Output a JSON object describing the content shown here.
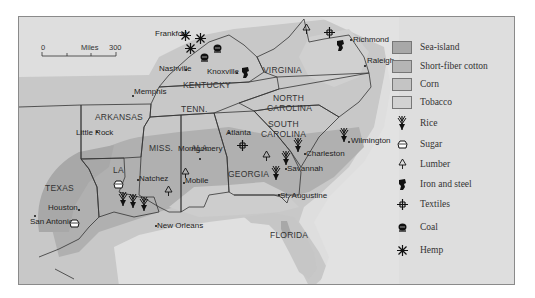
{
  "map": {
    "scale_bar": {
      "start": "0",
      "unit": "Miles",
      "end": "300"
    },
    "states": [
      {
        "name": "KENTUCKY",
        "x": 182,
        "y": 80
      },
      {
        "name": "VIRGINIA",
        "x": 262,
        "y": 65
      },
      {
        "name": "TENN.",
        "x": 180,
        "y": 104
      },
      {
        "name": "NORTH",
        "x": 272,
        "y": 93
      },
      {
        "name": "CAROLINA",
        "x": 266,
        "y": 103
      },
      {
        "name": "ARKANSAS",
        "x": 94,
        "y": 112
      },
      {
        "name": "SOUTH",
        "x": 267,
        "y": 119
      },
      {
        "name": "CAROLINA",
        "x": 260,
        "y": 129
      },
      {
        "name": "MISS.",
        "x": 148,
        "y": 143
      },
      {
        "name": "ALA.",
        "x": 190,
        "y": 143
      },
      {
        "name": "GEORGIA",
        "x": 227,
        "y": 169
      },
      {
        "name": "LA",
        "x": 112,
        "y": 165
      },
      {
        "name": "TEXAS",
        "x": 44,
        "y": 183
      },
      {
        "name": "FLORIDA",
        "x": 269,
        "y": 230
      }
    ],
    "cities": [
      {
        "name": "Frankfort",
        "x": 181,
        "y": 33,
        "dx": -27,
        "dy": -4
      },
      {
        "name": "Richmond",
        "x": 349,
        "y": 38,
        "dx": 3,
        "dy": -3
      },
      {
        "name": "Nashville",
        "x": 184,
        "y": 68,
        "dx": -26,
        "dy": -4
      },
      {
        "name": "Knoxville",
        "x": 235,
        "y": 71,
        "dx": -29,
        "dy": -4
      },
      {
        "name": "Raleigh",
        "x": 363,
        "y": 64,
        "dx": 3,
        "dy": -8
      },
      {
        "name": "Memphis",
        "x": 131,
        "y": 94,
        "dx": 2,
        "dy": -7
      },
      {
        "name": "Little Rock",
        "x": 95,
        "y": 130,
        "dx": -20,
        "dy": -2
      },
      {
        "name": "Atlanta",
        "x": 227,
        "y": 131,
        "dx": -2,
        "dy": -3
      },
      {
        "name": "Wilmington",
        "x": 347,
        "y": 140,
        "dx": 3,
        "dy": -4
      },
      {
        "name": "Montgomery",
        "x": 198,
        "y": 157,
        "dx": -21,
        "dy": -13
      },
      {
        "name": "Charleston",
        "x": 303,
        "y": 152,
        "dx": 2,
        "dy": -3
      },
      {
        "name": "Natchez",
        "x": 136,
        "y": 178,
        "dx": 2,
        "dy": -4
      },
      {
        "name": "Mobile",
        "x": 182,
        "y": 181,
        "dx": 2,
        "dy": -5
      },
      {
        "name": "Savannah",
        "x": 284,
        "y": 167,
        "dx": 2,
        "dy": -3
      },
      {
        "name": "St. Augustine",
        "x": 277,
        "y": 193,
        "dx": 2,
        "dy": -2
      },
      {
        "name": "Houston",
        "x": 77,
        "y": 208,
        "dx": -30,
        "dy": -5
      },
      {
        "name": "New Orleans",
        "x": 154,
        "y": 224,
        "dx": 2,
        "dy": -3
      },
      {
        "name": "San Antonio",
        "x": 33,
        "y": 214,
        "dx": -4,
        "dy": 3
      }
    ],
    "symbols": [
      {
        "type": "hemp",
        "x": 184,
        "y": 32
      },
      {
        "type": "hemp",
        "x": 199,
        "y": 35
      },
      {
        "type": "hemp",
        "x": 189,
        "y": 45
      },
      {
        "type": "coal",
        "x": 217,
        "y": 44
      },
      {
        "type": "coal",
        "x": 204,
        "y": 53
      },
      {
        "type": "lumber",
        "x": 306,
        "y": 26
      },
      {
        "type": "textiles",
        "x": 328,
        "y": 29
      },
      {
        "type": "iron",
        "x": 340,
        "y": 43
      },
      {
        "type": "iron",
        "x": 245,
        "y": 70
      },
      {
        "type": "rice",
        "x": 343,
        "y": 132
      },
      {
        "type": "rice",
        "x": 297,
        "y": 142
      },
      {
        "type": "rice",
        "x": 285,
        "y": 155
      },
      {
        "type": "rice",
        "x": 275,
        "y": 170
      },
      {
        "type": "textiles",
        "x": 241,
        "y": 142
      },
      {
        "type": "lumber",
        "x": 266,
        "y": 153
      },
      {
        "type": "lumber",
        "x": 185,
        "y": 170
      },
      {
        "type": "lumber",
        "x": 168,
        "y": 188
      },
      {
        "type": "sugar",
        "x": 117,
        "y": 180
      },
      {
        "type": "rice",
        "x": 122,
        "y": 196
      },
      {
        "type": "rice",
        "x": 132,
        "y": 198
      },
      {
        "type": "rice",
        "x": 143,
        "y": 201
      },
      {
        "type": "sugar",
        "x": 73,
        "y": 219
      }
    ]
  },
  "legend": {
    "areas": [
      {
        "label": "Sea-island",
        "color": "#a8a8a8"
      },
      {
        "label": "Short-fiber cotton",
        "color": "#b5b5b5"
      },
      {
        "label": "Corn",
        "color": "#c4c4c4"
      },
      {
        "label": "Tobacco",
        "color": "#d2d2d2"
      }
    ],
    "symbols": [
      {
        "label": "Rice",
        "icon": "rice"
      },
      {
        "label": "Sugar",
        "icon": "sugar"
      },
      {
        "label": "Lumber",
        "icon": "lumber"
      },
      {
        "label": "Iron and steel",
        "icon": "iron"
      },
      {
        "label": "Textiles",
        "icon": "textiles"
      },
      {
        "label": "Coal",
        "icon": "coal"
      },
      {
        "label": "Hemp",
        "icon": "hemp"
      }
    ]
  }
}
